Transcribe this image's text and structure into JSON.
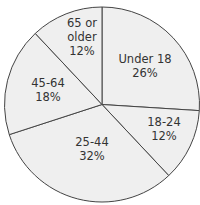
{
  "chart_data": {
    "type": "pie",
    "title": "",
    "start_angle_deg": 0,
    "direction": "clockwise",
    "categories": [
      "Under 18",
      "18-24",
      "25-44",
      "45-64",
      "65 or older"
    ],
    "values": [
      26,
      12,
      32,
      18,
      12
    ],
    "labels": [
      {
        "lines": [
          "Under 18",
          "26%"
        ],
        "x": 145,
        "y": 63
      },
      {
        "lines": [
          "18-24",
          "12%"
        ],
        "x": 164,
        "y": 126
      },
      {
        "lines": [
          "25-44",
          "32%"
        ],
        "x": 92,
        "y": 146
      },
      {
        "lines": [
          "45-64",
          "18%"
        ],
        "x": 48,
        "y": 87
      },
      {
        "lines": [
          "65 or",
          "older",
          "12%"
        ],
        "x": 82,
        "y": 27
      }
    ],
    "colors": {
      "fill": "#efefef",
      "stroke": "#444444",
      "text": "#333333"
    }
  }
}
